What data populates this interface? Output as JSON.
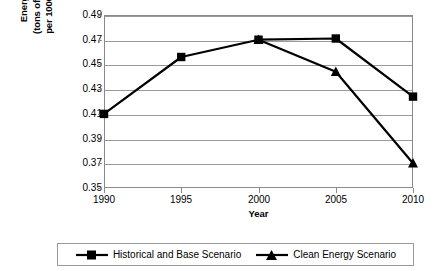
{
  "chart_data": {
    "type": "line",
    "title": "",
    "xlabel": "Year",
    "ylabel": "Energy Intensity (tons of oil equivalent per 1000 US$ of GDP)",
    "ylabel_lines": [
      "Energy Intensity",
      "(tons of oil equivalent",
      "per 1000 US$ of GDP)"
    ],
    "categories": [
      "1990",
      "1995",
      "2000",
      "2005",
      "2010"
    ],
    "x": [
      1990,
      1995,
      2000,
      2005,
      2010
    ],
    "xlim": [
      1990,
      2010
    ],
    "ylim": [
      0.35,
      0.49
    ],
    "yticks": [
      "0.49",
      "0.47",
      "0.45",
      "0.43",
      "0.41",
      "0.39",
      "0.37",
      "0.35"
    ],
    "ytick_values": [
      0.49,
      0.47,
      0.45,
      0.43,
      0.41,
      0.39,
      0.37,
      0.35
    ],
    "grid": true,
    "legend_position": "bottom",
    "series": [
      {
        "name": "Historical and Base Scenario",
        "marker": "square",
        "color": "#000000",
        "x": [
          1990,
          1995,
          2000,
          2005,
          2010
        ],
        "values": [
          0.41,
          0.456,
          0.47,
          0.471,
          0.424
        ]
      },
      {
        "name": "Clean Energy Scenario",
        "marker": "triangle",
        "color": "#000000",
        "x": [
          2000,
          2005,
          2010
        ],
        "values": [
          0.47,
          0.444,
          0.37
        ]
      }
    ]
  },
  "legend": {
    "entries": [
      {
        "label": "Historical and Base Scenario",
        "marker": "square"
      },
      {
        "label": "Clean Energy Scenario",
        "marker": "triangle"
      }
    ]
  },
  "colors": {
    "line": "#000000",
    "grid": "#9a9a9a",
    "frame": "#8a8a8a",
    "background": "#ffffff"
  }
}
